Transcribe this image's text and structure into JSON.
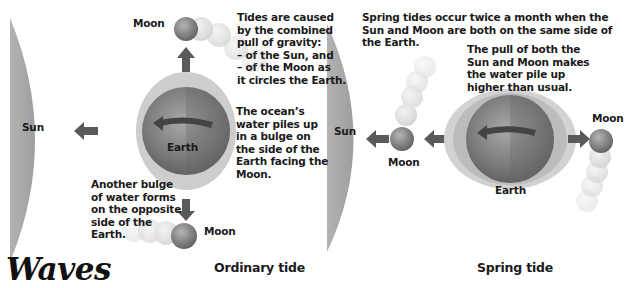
{
  "title": "Waves",
  "ordinary": {
    "caption": "Ordinary tide",
    "sun_label": "Sun",
    "earth_label": "Earth",
    "moon_top_label": "Moon",
    "moon_bottom_label": "Moon",
    "note_gravity": "Tides are caused\nby the combined\npull of gravity:\n– of the Sun, and\n– of the Moon as\nit circles the Earth.",
    "note_bulge": "The ocean’s\nwater piles up\nin a bulge on\nthe side of the\nEarth facing the\nMoon.",
    "note_opposite": "Another bulge\nof water forms\non the opposite\nside of the\nEarth."
  },
  "spring": {
    "caption": "Spring tide",
    "sun_label": "Sun",
    "earth_label": "Earth",
    "moon_left_label": "Moon",
    "moon_right_label": "Moon",
    "note_twice": "Spring tides occur twice a month when the\nSun and Moon are both on the same side of\nthe Earth.",
    "note_pull": "The pull of both the\nSun and Moon makes\nthe water pile up\nhigher than usual."
  },
  "colors": {
    "sun": "#a9a9a9",
    "earth_dark": "#6f6f6f",
    "earth_light": "#9a9a9a",
    "bulge": "#c4c4c4",
    "arrow": "#5a5a5a",
    "text": "#1a1a1a"
  }
}
